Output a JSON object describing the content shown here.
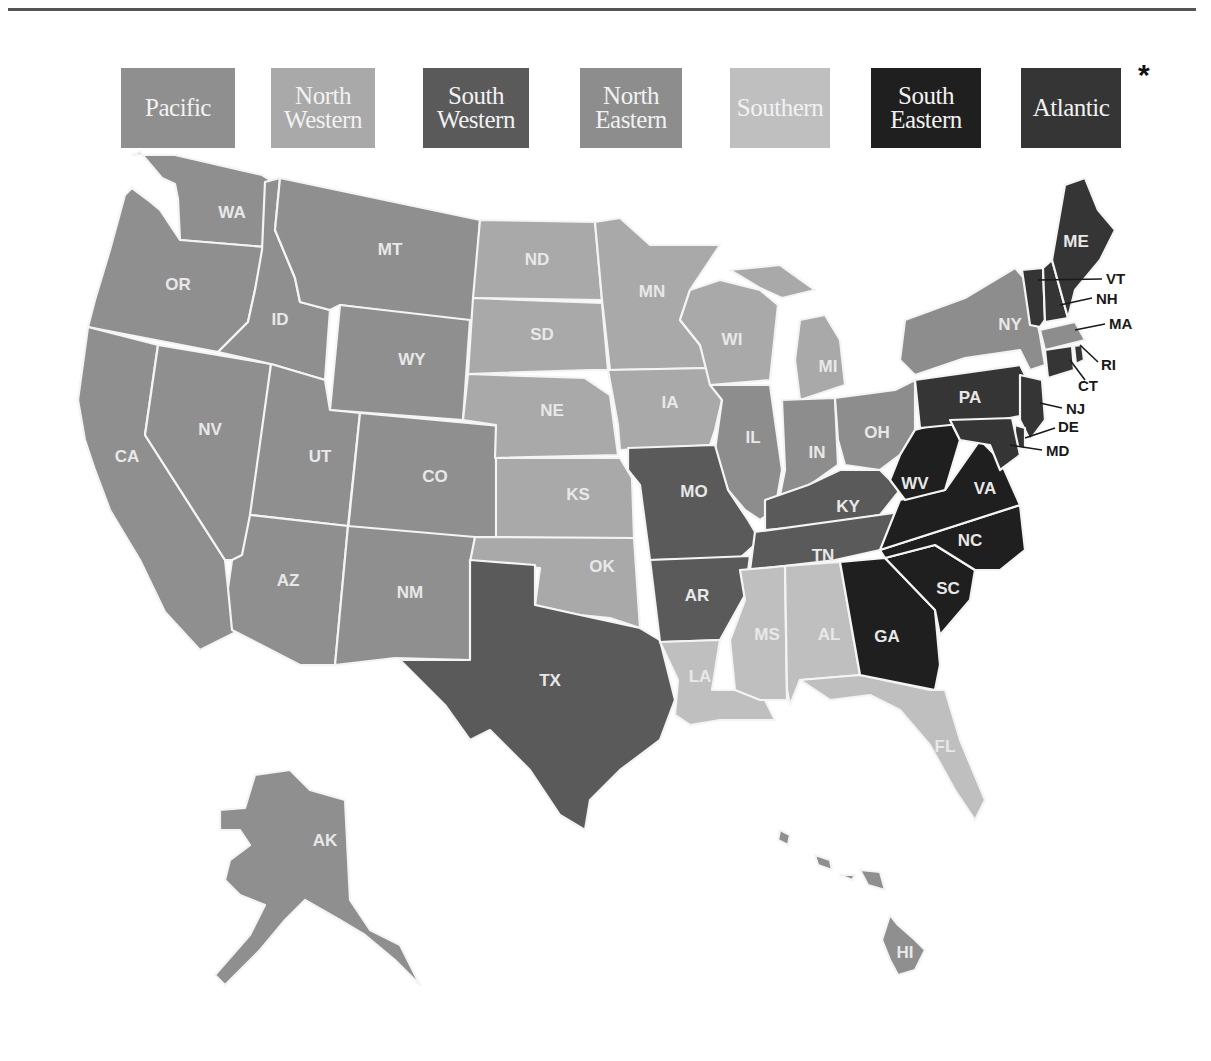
{
  "legend": {
    "items": [
      {
        "id": "pacific",
        "label": "Pacific",
        "color": "#8f8f8f",
        "x": 0,
        "w": 114
      },
      {
        "id": "north-western",
        "label": "North Western",
        "line1": "North",
        "line2": "Western",
        "color": "#a9a9a9",
        "x": 150,
        "w": 104
      },
      {
        "id": "south-western",
        "label": "South Western",
        "line1": "South",
        "line2": "Western",
        "color": "#5a5a5a",
        "x": 302,
        "w": 106
      },
      {
        "id": "north-eastern",
        "label": "North Eastern",
        "line1": "North",
        "line2": "Eastern",
        "color": "#8d8d8d",
        "x": 459,
        "w": 102
      },
      {
        "id": "southern",
        "label": "Southern",
        "color": "#bfbfbf",
        "x": 609,
        "w": 100
      },
      {
        "id": "south-eastern",
        "label": "South Eastern",
        "line1": "South",
        "line2": "Eastern",
        "color": "#1f1f1f",
        "x": 750,
        "w": 110
      },
      {
        "id": "atlantic",
        "label": "Atlantic",
        "color": "#353535",
        "x": 900,
        "w": 100
      }
    ],
    "asterisk": "*"
  },
  "map": {
    "states": {
      "WA": "WA",
      "OR": "OR",
      "CA": "CA",
      "NV": "NV",
      "ID": "ID",
      "MT": "MT",
      "WY": "WY",
      "UT": "UT",
      "CO": "CO",
      "AZ": "AZ",
      "NM": "NM",
      "ND": "ND",
      "SD": "SD",
      "NE": "NE",
      "KS": "KS",
      "OK": "OK",
      "TX": "TX",
      "MN": "MN",
      "IA": "IA",
      "MO": "MO",
      "AR": "AR",
      "LA": "LA",
      "WI": "WI",
      "IL": "IL",
      "MI": "MI",
      "IN": "IN",
      "OH": "OH",
      "KY": "KY",
      "TN": "TN",
      "MS": "MS",
      "AL": "AL",
      "GA": "GA",
      "FL": "FL",
      "SC": "SC",
      "NC": "NC",
      "VA": "VA",
      "WV": "WV",
      "PA": "PA",
      "NY": "NY",
      "NJ": "NJ",
      "DE": "DE",
      "MD": "MD",
      "CT": "CT",
      "RI": "RI",
      "MA": "MA",
      "NH": "NH",
      "VT": "VT",
      "ME": "ME",
      "AK": "AK",
      "HI": "HI"
    }
  }
}
